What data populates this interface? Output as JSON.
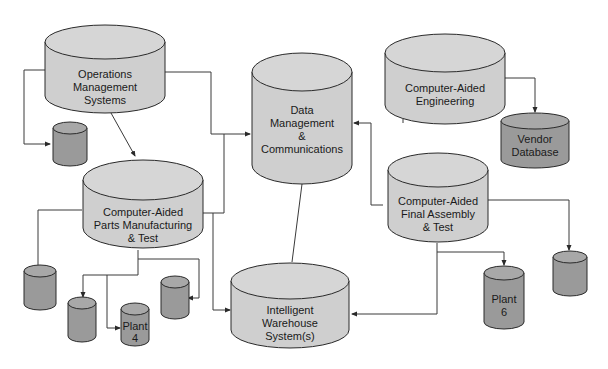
{
  "diagram": {
    "colors": {
      "large_fill": "#cfcfcf",
      "large_top": "#d6d6d6",
      "small_fill": "#9a9a9a",
      "small_top": "#a8a8a8",
      "stroke": "#2a2a2a",
      "line": "#3a3a3a"
    },
    "nodes": [
      {
        "id": "operations",
        "lines": [
          "Operations",
          "Management",
          "Systems"
        ],
        "type": "large"
      },
      {
        "id": "data-management",
        "lines": [
          "Data",
          "Management",
          "&",
          "Communications"
        ],
        "type": "large"
      },
      {
        "id": "cae",
        "lines": [
          "Computer-Aided",
          "Engineering"
        ],
        "type": "large"
      },
      {
        "id": "vendor-db",
        "lines": [
          "Vendor",
          "Database"
        ],
        "type": "small"
      },
      {
        "id": "parts-mfg",
        "lines": [
          "Computer-Aided",
          "Parts Manufacturing",
          "& Test"
        ],
        "type": "large"
      },
      {
        "id": "final-assembly",
        "lines": [
          "Computer-Aided",
          "Final Assembly",
          "& Test"
        ],
        "type": "large"
      },
      {
        "id": "warehouse",
        "lines": [
          "Intelligent",
          "Warehouse",
          "System(s)"
        ],
        "type": "large"
      },
      {
        "id": "plant-4",
        "lines": [
          "Plant",
          "4"
        ],
        "type": "small"
      },
      {
        "id": "plant-6",
        "lines": [
          "Plant",
          "6"
        ],
        "type": "small"
      },
      {
        "id": "ops-db",
        "lines": [],
        "type": "small"
      },
      {
        "id": "parts-db-1",
        "lines": [],
        "type": "small"
      },
      {
        "id": "parts-db-2",
        "lines": [],
        "type": "small"
      },
      {
        "id": "parts-db-3",
        "lines": [],
        "type": "small"
      },
      {
        "id": "assembly-db",
        "lines": [],
        "type": "small"
      }
    ],
    "edges": [
      {
        "from": "operations",
        "to": "ops-db"
      },
      {
        "from": "operations",
        "to": "parts-mfg"
      },
      {
        "from": "operations",
        "to": "data-management"
      },
      {
        "from": "cae",
        "to": "data-management"
      },
      {
        "from": "cae",
        "to": "vendor-db"
      },
      {
        "from": "final-assembly",
        "to": "data-management"
      },
      {
        "from": "final-assembly",
        "to": "assembly-db"
      },
      {
        "from": "final-assembly",
        "to": "plant-6"
      },
      {
        "from": "final-assembly",
        "to": "warehouse"
      },
      {
        "from": "parts-mfg",
        "to": "data-management"
      },
      {
        "from": "parts-mfg",
        "to": "warehouse"
      },
      {
        "from": "parts-mfg",
        "to": "parts-db-1"
      },
      {
        "from": "parts-mfg",
        "to": "parts-db-2"
      },
      {
        "from": "parts-mfg",
        "to": "plant-4"
      },
      {
        "from": "parts-mfg",
        "to": "parts-db-3"
      },
      {
        "from": "data-management",
        "to": "warehouse"
      }
    ]
  }
}
